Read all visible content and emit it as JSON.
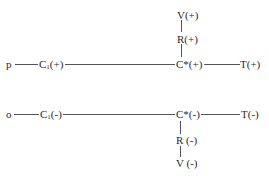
{
  "diagram": {
    "top_row": {
      "start": "p",
      "c1_base": "C",
      "c1_sub": "1",
      "c1_sign": "(+)",
      "cstar": "C*(+)",
      "terminal": "T(+)",
      "branch_up_1": "R(+)",
      "branch_up_2": "V(+)"
    },
    "bottom_row": {
      "start": "o",
      "c1_base": "C",
      "c1_sub": "1",
      "c1_sign": "(-)",
      "cstar": "C*(-)",
      "terminal": "T(-)",
      "branch_down_1": "R (-)",
      "branch_down_2": "V (-)"
    }
  }
}
